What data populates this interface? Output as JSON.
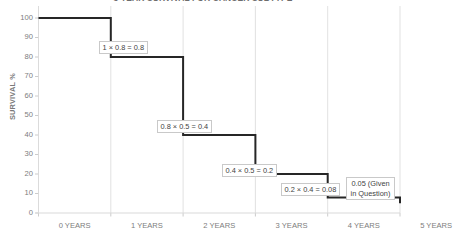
{
  "chart_data": {
    "type": "line",
    "subtype": "step",
    "title": "5 YEAR SURVIVAL FOR CANCER SUBTYPE",
    "xlabel": "",
    "ylabel": "SURVIVAL %",
    "x_tick_labels": [
      "0 YEARS",
      "1 YEARS",
      "2 YEARS",
      "3 YEARS",
      "4 YEARS",
      "5 YEARS"
    ],
    "x_values": [
      0,
      1,
      2,
      3,
      4,
      5
    ],
    "y_tick_labels": [
      "100",
      "90",
      "80",
      "70",
      "60",
      "50",
      "40",
      "30",
      "20",
      "10",
      "0"
    ],
    "y_values": [
      100,
      90,
      80,
      70,
      60,
      50,
      40,
      30,
      20,
      10,
      0
    ],
    "ylim": [
      0,
      100
    ],
    "xlim": [
      0,
      5
    ],
    "grid": "vertical",
    "legend": "none",
    "series": [
      {
        "name": "Survival",
        "step_mode": "post",
        "values": [
          100,
          80,
          40,
          20,
          8,
          5
        ],
        "color": "#262626"
      }
    ],
    "annotations": [
      {
        "text": "1 × 0.8 = 0.8",
        "interval": "0-1 years",
        "result": 0.8
      },
      {
        "text": "0.8 × 0.5 = 0.4",
        "interval": "1-2 years",
        "result": 0.4
      },
      {
        "text": "0.4 × 0.5 = 0.2",
        "interval": "2-3 years",
        "result": 0.2
      },
      {
        "text": "0.2 × 0.4 = 0.08",
        "interval": "3-4 years",
        "result": 0.08
      },
      {
        "text": "0.05 (Given in Question)",
        "interval": "4-5 years",
        "result": 0.05
      }
    ]
  },
  "colors": {
    "line": "#262626",
    "gridline": "#d9d9d9",
    "axis": "#bfbfbf",
    "tick_text": "#7d7d7d",
    "annotation_text": "#3f3f3f",
    "annotation_border": "#c9c9c9",
    "background": "#ffffff"
  },
  "axis": {
    "y_title": "SURVIVAL %",
    "y_ticks": [
      "100",
      "90",
      "80",
      "70",
      "60",
      "50",
      "40",
      "30",
      "20",
      "10",
      "0"
    ],
    "x_ticks": [
      "0 YEARS",
      "1 YEARS",
      "2 YEARS",
      "3 YEARS",
      "4 YEARS",
      "5 YEARS"
    ]
  },
  "annotation_text": {
    "a0": "1 × 0.8 = 0.8",
    "a1": "0.8 × 0.5 = 0.4",
    "a2": "0.4 × 0.5 = 0.2",
    "a3": "0.2 × 0.4 = 0.08",
    "a4": "0.05 (Given in Question)"
  }
}
